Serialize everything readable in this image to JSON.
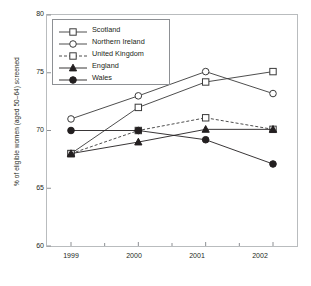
{
  "chart_data": {
    "type": "line",
    "title": "",
    "xlabel": "",
    "ylabel": "% of eligible women (aged 50–64) screened",
    "categories": [
      "1999",
      "2000",
      "2001",
      "2002"
    ],
    "ylim": [
      60,
      80
    ],
    "yticks": [
      60,
      65,
      70,
      75,
      80
    ],
    "ytick_labels": [
      "60",
      "65",
      "70",
      "75",
      "80"
    ],
    "xtick_labels": [
      "1999",
      "2000",
      "2001",
      "2002"
    ],
    "grid": false,
    "legend_position": "top-left-inside",
    "series": [
      {
        "name": "Scotland",
        "values": [
          68.0,
          72.0,
          74.2,
          75.1
        ],
        "marker": "open-square",
        "line_style": "solid",
        "color": "#3a3a3a"
      },
      {
        "name": "Northern Ireland",
        "values": [
          71.0,
          73.0,
          75.1,
          73.2
        ],
        "marker": "open-circle",
        "line_style": "solid",
        "color": "#3a3a3a"
      },
      {
        "name": "United Kingdom",
        "values": [
          68.0,
          70.0,
          71.1,
          70.1
        ],
        "marker": "open-square",
        "line_style": "dashed",
        "color": "#3a3a3a"
      },
      {
        "name": "England",
        "values": [
          68.0,
          69.0,
          70.1,
          70.1
        ],
        "marker": "filled-triangle",
        "line_style": "solid",
        "color": "#231f20"
      },
      {
        "name": "Wales",
        "values": [
          70.0,
          70.0,
          69.2,
          67.1
        ],
        "marker": "filled-circle",
        "line_style": "solid",
        "color": "#231f20"
      }
    ]
  },
  "legend": {
    "entries": [
      {
        "label": "Scotland"
      },
      {
        "label": "Northern Ireland"
      },
      {
        "label": "United Kingdom"
      },
      {
        "label": "England"
      },
      {
        "label": "Wales"
      }
    ]
  },
  "colors": {
    "frame": "#b9bcbe",
    "legend_border": "#8d9094",
    "text": "#231f20",
    "line_light": "#3a3a3a",
    "line_dark": "#231f20",
    "background": "#ffffff"
  }
}
